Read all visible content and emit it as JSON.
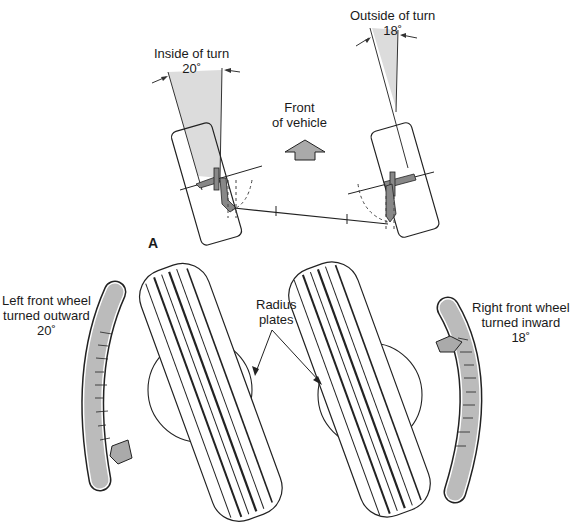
{
  "figure": {
    "part_a_label": "A",
    "inside_turn": {
      "title": "Inside of turn",
      "angle": "20˚"
    },
    "outside_turn": {
      "title": "Outside of turn",
      "angle": "18˚"
    },
    "front": {
      "line1": "Front",
      "line2": "of vehicle"
    },
    "radius_plates": {
      "line1": "Radius",
      "line2": "plates"
    },
    "left_wheel": {
      "line1": "Left front wheel",
      "line2": "turned outward",
      "angle": "20˚"
    },
    "right_wheel": {
      "line1": "Right front wheel",
      "line2": "turned inward",
      "angle": "18˚"
    },
    "scale_ticks": [
      "20",
      "15",
      "10",
      "5",
      "0",
      "5",
      "10",
      "15",
      "20"
    ]
  },
  "colors": {
    "shade": "#d9d9d9",
    "gauge": "#b8b8b8",
    "line": "#222222"
  }
}
